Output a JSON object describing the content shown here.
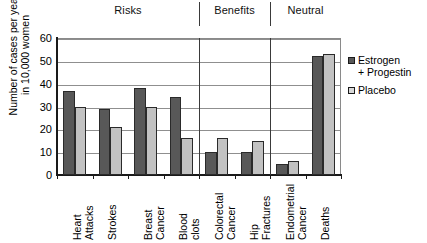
{
  "chart_data": {
    "type": "bar",
    "title": "",
    "xlabel": "",
    "ylabel": "Number of cases per year\nin 10,000 women",
    "ylabel_line1": "Number of cases per year",
    "ylabel_line2": "in 10,000 women",
    "ylim": [
      0,
      60
    ],
    "ytick_values": [
      0,
      10,
      20,
      30,
      40,
      50,
      60
    ],
    "ytick_labels": [
      "0",
      "10",
      "20",
      "30",
      "40",
      "50",
      "60"
    ],
    "grid": "horizontal",
    "legend_position": "right",
    "categories": [
      "Heart Attacks",
      "Strokes",
      "Breast Cancer",
      "Blood clots",
      "Colorectal Cancer",
      "Hip Fractures",
      "Endometrial Cancer",
      "Deaths"
    ],
    "category_labels": [
      "Heart\nAttacks",
      "Strokes",
      "Breast\nCancer",
      "Blood\nclots",
      "Colorectal\nCancer",
      "Hip\nFractures",
      "Endometrial\nCancer",
      "Deaths"
    ],
    "series": [
      {
        "name": "Estrogen + Progestin",
        "legend_label": "Estrogen\n+ Progestin",
        "color": "#585858",
        "values": [
          37,
          29,
          38,
          34,
          10,
          10,
          5,
          52
        ]
      },
      {
        "name": "Placebo",
        "legend_label": "Placebo",
        "color": "#c2c2c2",
        "values": [
          30,
          21,
          30,
          16,
          16,
          15,
          6,
          53
        ]
      }
    ],
    "sections": [
      {
        "label": "Risks",
        "category_start": 0,
        "category_end": 3
      },
      {
        "label": "Benefits",
        "category_start": 4,
        "category_end": 5
      },
      {
        "label": "Neutral",
        "category_start": 6,
        "category_end": 7
      }
    ],
    "section_dividers_after_category": [
      3,
      5
    ]
  },
  "legend": {
    "items": [
      {
        "label": "Estrogen\n+ Progestin",
        "color": "#585858"
      },
      {
        "label": "Placebo",
        "color": "#d8d8d8"
      }
    ]
  }
}
